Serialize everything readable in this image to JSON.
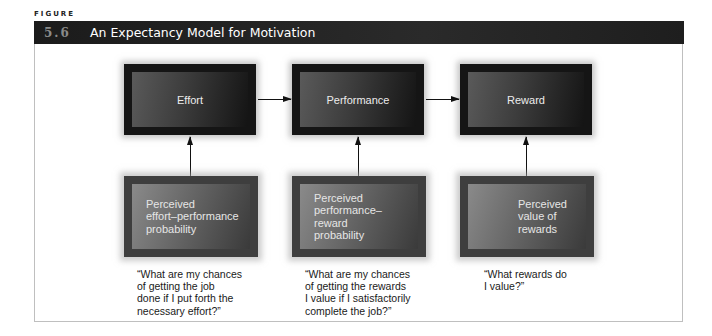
{
  "figure": {
    "label": "FIGURE",
    "number": "5.6",
    "title": "An Expectancy Model for Motivation"
  },
  "diagram": {
    "top_boxes": [
      {
        "label": "Effort"
      },
      {
        "label": "Performance"
      },
      {
        "label": "Reward"
      }
    ],
    "bottom_boxes": [
      {
        "label": "Perceived\neffort–performance\nprobability"
      },
      {
        "label": "Perceived\nperformance–reward\nprobability"
      },
      {
        "label": "Perceived\nvalue of\nrewards"
      }
    ],
    "captions": [
      "“What are my chances\nof getting the job\ndone if I put forth the\nnecessary effort?”",
      "“What are my chances\nof getting the rewards\nI value if I satisfactorily\ncomplete the job?”",
      "“What rewards do\nI value?”"
    ],
    "edges": [
      {
        "from": "Effort",
        "to": "Performance"
      },
      {
        "from": "Performance",
        "to": "Reward"
      },
      {
        "from": "Perceived effort–performance probability",
        "to": "Effort"
      },
      {
        "from": "Perceived performance–reward probability",
        "to": "Performance"
      },
      {
        "from": "Perceived value of rewards",
        "to": "Reward"
      }
    ]
  }
}
